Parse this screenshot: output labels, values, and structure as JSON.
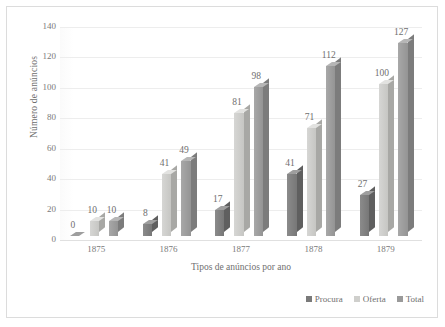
{
  "chart_data": {
    "type": "bar",
    "title": "",
    "subtitle": "",
    "xlabel": "Tipos de anúncios por ano",
    "ylabel": "Número de anúncios",
    "categories": [
      "1875",
      "1876",
      "1877",
      "1878",
      "1879"
    ],
    "series": [
      {
        "name": "Procura",
        "color": "#7a7a7a",
        "values": [
          0,
          8,
          17,
          41,
          27
        ]
      },
      {
        "name": "Oferta",
        "color": "#cfcfcc",
        "values": [
          10,
          41,
          81,
          71,
          100
        ]
      },
      {
        "name": "Total",
        "color": "#9a9a9a",
        "values": [
          10,
          49,
          98,
          112,
          127
        ]
      }
    ],
    "ylim": [
      0,
      140
    ],
    "ytick_values": [
      0,
      20,
      40,
      60,
      80,
      100,
      120,
      140
    ],
    "ytick_labels": [
      "0",
      "20",
      "40",
      "60",
      "80",
      "100",
      "120",
      "140"
    ],
    "grid": true,
    "grid_axis": "y",
    "legend_position": "bottom-right",
    "legend_entries": [
      "Procura",
      "Oferta",
      "Total"
    ],
    "bar_style": "3d-clustered-column",
    "data_labels_shown": true
  },
  "axes": {
    "y_title": "Número de anúncios",
    "x_title": "Tipos de anúncios por ano"
  },
  "legend": {
    "items": [
      {
        "label": "Procura"
      },
      {
        "label": "Oferta"
      },
      {
        "label": "Total"
      }
    ]
  },
  "colors": {
    "procura": "#7a7a7a",
    "oferta": "#cfcfcc",
    "total": "#9a9a9a",
    "grid": "#ededed",
    "border": "#dcdcdc",
    "text": "#6f6f6f"
  }
}
